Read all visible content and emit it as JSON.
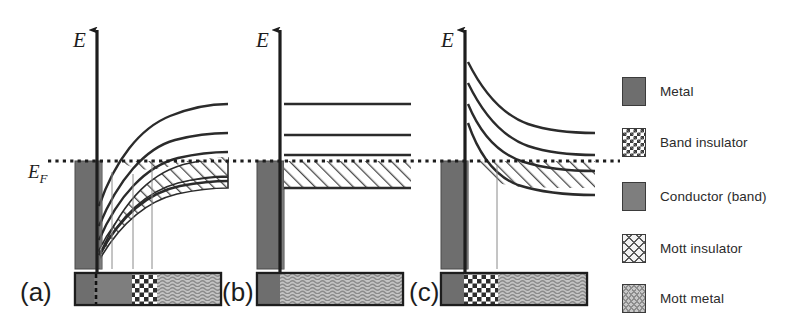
{
  "figure": {
    "type": "diagram",
    "background_color": "#ffffff",
    "line_color": "#2b2b2b",
    "fermi_level_label": "E",
    "fermi_level_sub": "F",
    "energy_axis_label": "E"
  },
  "panels": [
    {
      "id": "a",
      "label": "(a)",
      "axis_label": "E",
      "fermi_label_visible": true,
      "band_style": "rising-curves",
      "curve_count": 4,
      "hatched_regions": 2,
      "phase_bar": [
        {
          "phase": "Metal",
          "pattern": "solid-dark",
          "width_frac": 0.12
        },
        {
          "phase": "Conductor (band)",
          "pattern": "solid-gray",
          "width_frac": 0.26
        },
        {
          "phase": "Band insulator",
          "pattern": "checker",
          "width_frac": 0.17
        },
        {
          "phase": "Mott metal",
          "pattern": "wavy",
          "width_frac": 0.45
        }
      ],
      "drop_lines": 4
    },
    {
      "id": "b",
      "label": "(b)",
      "axis_label": "E",
      "fermi_label_visible": false,
      "band_style": "flat-levels",
      "curve_count": 3,
      "hatched_regions": 1,
      "phase_bar": [
        {
          "phase": "Metal",
          "pattern": "solid-dark",
          "width_frac": 0.12
        },
        {
          "phase": "Mott metal",
          "pattern": "wavy",
          "width_frac": 0.88
        }
      ],
      "drop_lines": 1
    },
    {
      "id": "c",
      "label": "(c)",
      "axis_label": "E",
      "fermi_label_visible": false,
      "band_style": "falling-curves",
      "curve_count": 4,
      "hatched_regions": 1,
      "phase_bar": [
        {
          "phase": "Metal",
          "pattern": "solid-dark",
          "width_frac": 0.12
        },
        {
          "phase": "Band insulator",
          "pattern": "checker",
          "width_frac": 0.24
        },
        {
          "phase": "Mott metal",
          "pattern": "wavy",
          "width_frac": 0.64
        }
      ],
      "drop_lines": 2
    }
  ],
  "legend": {
    "items": [
      {
        "label": "Metal",
        "pattern": "solid-dark",
        "color": "#6e6e6e"
      },
      {
        "label": "Band insulator",
        "pattern": "checker",
        "color": "#3a3a3a"
      },
      {
        "label": "Conductor (band)",
        "pattern": "solid-gray",
        "color": "#7e7e7e"
      },
      {
        "label": "Mott insulator",
        "pattern": "crosshatch",
        "color": "#585858"
      },
      {
        "label": "Mott metal",
        "pattern": "wavy",
        "color": "#8d8d8d"
      }
    ]
  }
}
